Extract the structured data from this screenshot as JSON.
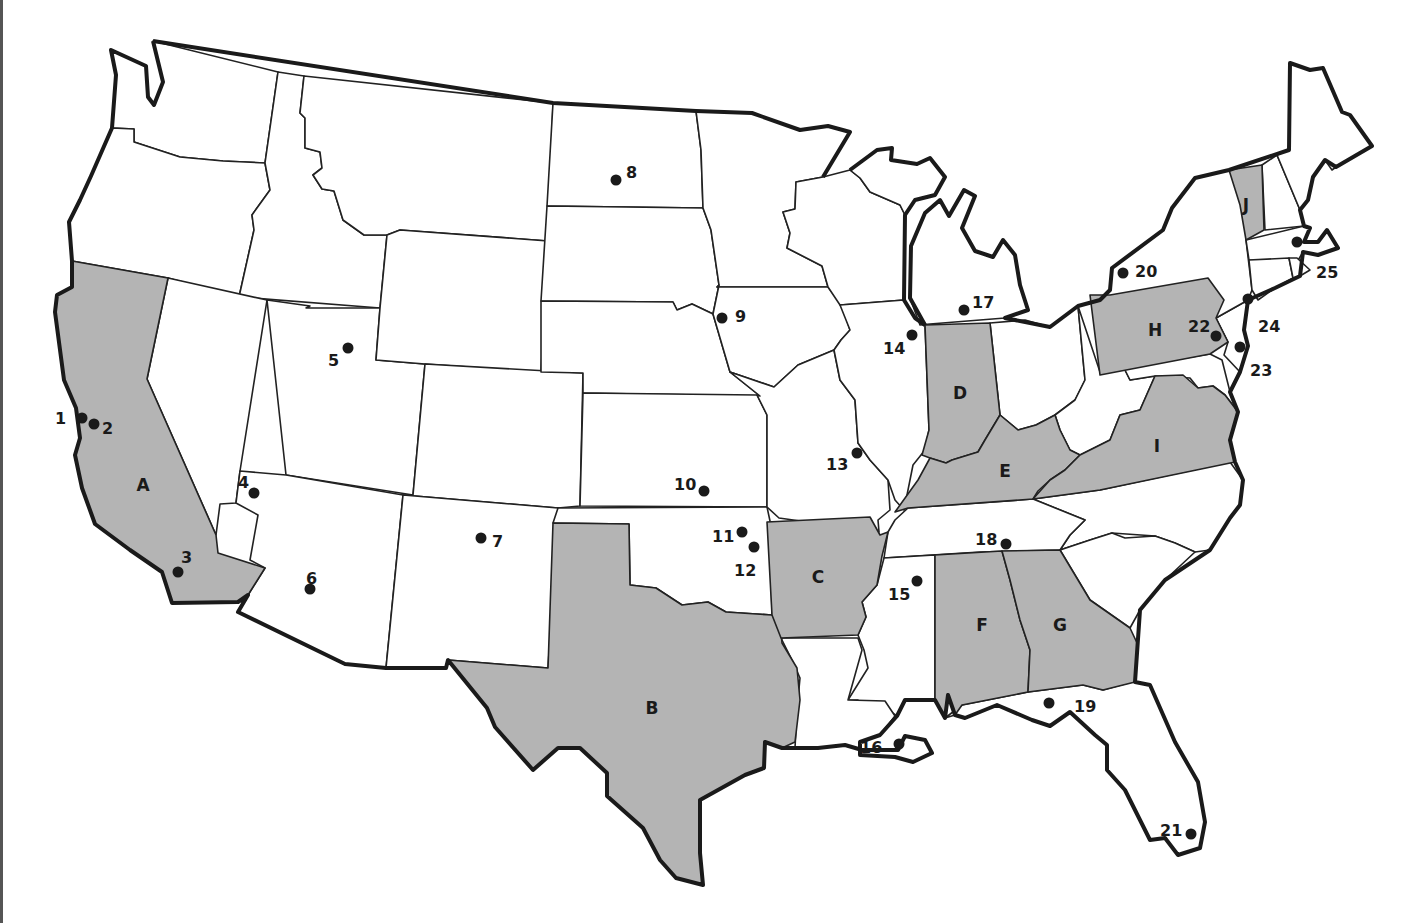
{
  "map": {
    "title": "",
    "shade_color": "#b4b4b4",
    "outline_color": "#1a1a1a",
    "shaded_states": [
      {
        "letter": "A",
        "state": "California",
        "label_x": 143,
        "label_y": 485
      },
      {
        "letter": "B",
        "state": "Texas",
        "label_x": 652,
        "label_y": 708
      },
      {
        "letter": "C",
        "state": "Arkansas",
        "label_x": 818,
        "label_y": 577
      },
      {
        "letter": "D",
        "state": "Indiana",
        "label_x": 960,
        "label_y": 393
      },
      {
        "letter": "E",
        "state": "Kentucky",
        "label_x": 1005,
        "label_y": 471
      },
      {
        "letter": "F",
        "state": "Alabama",
        "label_x": 982,
        "label_y": 625
      },
      {
        "letter": "G",
        "state": "Georgia",
        "label_x": 1060,
        "label_y": 625
      },
      {
        "letter": "H",
        "state": "Pennsylvania",
        "label_x": 1155,
        "label_y": 330
      },
      {
        "letter": "I",
        "state": "Virginia",
        "label_x": 1157,
        "label_y": 446
      },
      {
        "letter": "J",
        "state": "Vermont",
        "label_x": 1246,
        "label_y": 205
      }
    ],
    "points": [
      {
        "n": "1",
        "x": 82,
        "y": 418,
        "lx": 55,
        "ly": 418
      },
      {
        "n": "2",
        "x": 94,
        "y": 424,
        "lx": 102,
        "ly": 428
      },
      {
        "n": "3",
        "x": 178,
        "y": 572,
        "lx": 181,
        "ly": 557
      },
      {
        "n": "4",
        "x": 254,
        "y": 493,
        "lx": 238,
        "ly": 482
      },
      {
        "n": "5",
        "x": 348,
        "y": 348,
        "lx": 328,
        "ly": 360
      },
      {
        "n": "6",
        "x": 310,
        "y": 589,
        "lx": 306,
        "ly": 578
      },
      {
        "n": "7",
        "x": 481,
        "y": 538,
        "lx": 492,
        "ly": 541
      },
      {
        "n": "8",
        "x": 616,
        "y": 180,
        "lx": 626,
        "ly": 172
      },
      {
        "n": "9",
        "x": 722,
        "y": 318,
        "lx": 735,
        "ly": 316
      },
      {
        "n": "10",
        "x": 704,
        "y": 491,
        "lx": 674,
        "ly": 484
      },
      {
        "n": "11",
        "x": 742,
        "y": 532,
        "lx": 712,
        "ly": 536
      },
      {
        "n": "12",
        "x": 754,
        "y": 547,
        "lx": 734,
        "ly": 570
      },
      {
        "n": "13",
        "x": 857,
        "y": 453,
        "lx": 826,
        "ly": 464
      },
      {
        "n": "14",
        "x": 912,
        "y": 335,
        "lx": 883,
        "ly": 348
      },
      {
        "n": "15",
        "x": 917,
        "y": 581,
        "lx": 888,
        "ly": 594
      },
      {
        "n": "16",
        "x": 899,
        "y": 744,
        "lx": 860,
        "ly": 747
      },
      {
        "n": "17",
        "x": 964,
        "y": 310,
        "lx": 972,
        "ly": 302
      },
      {
        "n": "18",
        "x": 1006,
        "y": 544,
        "lx": 975,
        "ly": 539
      },
      {
        "n": "19",
        "x": 1049,
        "y": 703,
        "lx": 1074,
        "ly": 706
      },
      {
        "n": "20",
        "x": 1123,
        "y": 273,
        "lx": 1135,
        "ly": 271
      },
      {
        "n": "21",
        "x": 1191,
        "y": 834,
        "lx": 1160,
        "ly": 830
      },
      {
        "n": "22",
        "x": 1216,
        "y": 336,
        "lx": 1188,
        "ly": 326
      },
      {
        "n": "23",
        "x": 1240,
        "y": 347,
        "lx": 1250,
        "ly": 370
      },
      {
        "n": "24",
        "x": 1248,
        "y": 299,
        "lx": 1258,
        "ly": 326
      },
      {
        "n": "25",
        "x": 1297,
        "y": 242,
        "lx": 1316,
        "ly": 272
      }
    ]
  }
}
